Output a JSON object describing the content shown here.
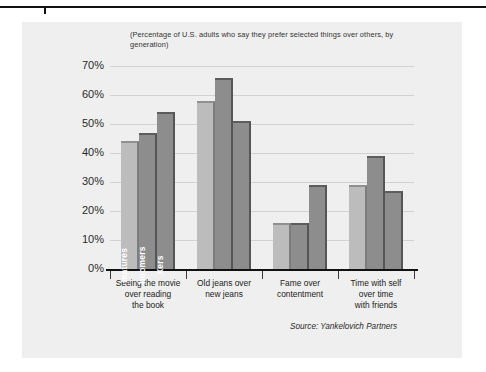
{
  "chart_data": {
    "type": "bar",
    "title": "",
    "subtitle": "(Percentage of U.S. adults who say they prefer selected things over others, by generation)",
    "xlabel": "",
    "ylabel": "",
    "ylim": [
      0,
      70
    ],
    "ytick_labels": [
      "70%",
      "60%",
      "50%",
      "40%",
      "30%",
      "20%",
      "10%",
      "0%"
    ],
    "ytick_values": [
      70,
      60,
      50,
      40,
      30,
      20,
      10,
      0
    ],
    "grid": true,
    "legend_position": "inside-first-group-vertical",
    "categories": [
      "Seeing the movie over reading the book",
      "Old jeans over new jeans",
      "Fame over contentment",
      "Time with self over time with friends"
    ],
    "category_lines": [
      [
        "Seeing the movie",
        "over reading",
        "the book"
      ],
      [
        "Old jeans over",
        "new jeans"
      ],
      [
        "Fame over",
        "contentment"
      ],
      [
        "Time with self",
        "over time",
        "with friends"
      ]
    ],
    "series": [
      {
        "name": "matures",
        "values": [
          44,
          58,
          16,
          29
        ],
        "color": "#bcbcbc"
      },
      {
        "name": "boomers",
        "values": [
          47,
          66,
          16,
          39
        ],
        "color": "#8d8d8d"
      },
      {
        "name": "Xers",
        "values": [
          54,
          51,
          29,
          27
        ],
        "color": "#8d8d8d"
      }
    ],
    "source": "Source: Yankelovich Partners"
  },
  "colors": {
    "panel_background": "#efefef",
    "page_background": "#ffffff",
    "gridline": "#d2d2d2",
    "axis": "#111111",
    "series_light": "#bcbcbc",
    "series_dark": "#8d8d8d",
    "text": "#2b2b2b"
  }
}
